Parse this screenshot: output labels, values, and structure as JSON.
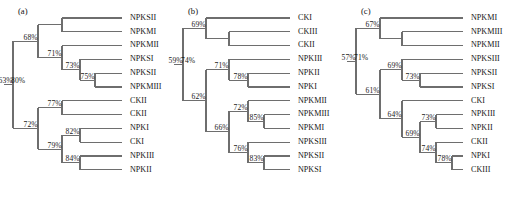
{
  "figure": {
    "width": 525,
    "height": 201,
    "background": "#ffffff",
    "link_color": "#6e6e6e",
    "text_color": "#171717"
  },
  "panels": [
    {
      "id": "a",
      "tag": "(a)",
      "root_support": "63%",
      "leaves": [
        "NPKSII",
        "NPKMI",
        "NPKMII",
        "NPKSI",
        "NPKSII",
        "NPKMIII",
        "CKII",
        "CKII",
        "NPKI",
        "CKI",
        "NPKIII",
        "NPKII"
      ],
      "supports": [
        "63%",
        "68%",
        "80%",
        "71%",
        "73%",
        "75%",
        "72%",
        "77%",
        "79%",
        "82%",
        "84%"
      ],
      "tree": {
        "support": "63%",
        "children": [
          {
            "support": "68%",
            "children": [
              {
                "support": "80%",
                "children": [
                  {
                    "leaf": "NPKSII"
                  },
                  {
                    "leaf": "NPKMI"
                  }
                ]
              },
              {
                "support": "71%",
                "children": [
                  {
                    "leaf": "NPKMII"
                  },
                  {
                    "support": "73%",
                    "children": [
                      {
                        "leaf": "NPKSI"
                      },
                      {
                        "support": "75%",
                        "children": [
                          {
                            "leaf": "NPKSII"
                          },
                          {
                            "leaf": "NPKMIII"
                          }
                        ]
                      }
                    ]
                  }
                ]
              }
            ]
          },
          {
            "support": "72%",
            "children": [
              {
                "support": "77%",
                "children": [
                  {
                    "leaf": "CKII"
                  },
                  {
                    "leaf": "CKII"
                  }
                ]
              },
              {
                "support": "79%",
                "children": [
                  {
                    "support": "82%",
                    "children": [
                      {
                        "leaf": "NPKI"
                      },
                      {
                        "leaf": "CKI"
                      }
                    ]
                  },
                  {
                    "support": "84%",
                    "children": [
                      {
                        "leaf": "NPKIII"
                      },
                      {
                        "leaf": "NPKII"
                      }
                    ]
                  }
                ]
              }
            ]
          }
        ]
      }
    },
    {
      "id": "b",
      "tag": "(b)",
      "root_support": "59%",
      "leaves": [
        "CKI",
        "CKIII",
        "CKII",
        "NPKIII",
        "NPKII",
        "NPKI",
        "NPKMII",
        "NPKMIII",
        "NPKMI",
        "NPKSIII",
        "NPKSII",
        "NPKSI"
      ],
      "supports": [
        "59%",
        "69%",
        "74%",
        "62%",
        "71%",
        "78%",
        "66%",
        "72%",
        "85%",
        "76%",
        "83%"
      ],
      "tree": {
        "support": "59%",
        "children": [
          {
            "support": "69%",
            "children": [
              {
                "leaf": "CKI"
              },
              {
                "support": "74%",
                "children": [
                  {
                    "leaf": "CKIII"
                  },
                  {
                    "leaf": "CKII"
                  }
                ]
              }
            ]
          },
          {
            "support": "62%",
            "children": [
              {
                "support": "71%",
                "children": [
                  {
                    "leaf": "NPKIII"
                  },
                  {
                    "support": "78%",
                    "children": [
                      {
                        "leaf": "NPKII"
                      },
                      {
                        "leaf": "NPKI"
                      }
                    ]
                  }
                ]
              },
              {
                "support": "66%",
                "children": [
                  {
                    "support": "72%",
                    "children": [
                      {
                        "leaf": "NPKMII"
                      },
                      {
                        "support": "85%",
                        "children": [
                          {
                            "leaf": "NPKMIII"
                          },
                          {
                            "leaf": "NPKMI"
                          }
                        ]
                      }
                    ]
                  },
                  {
                    "support": "76%",
                    "children": [
                      {
                        "leaf": "NPKSIII"
                      },
                      {
                        "support": "83%",
                        "children": [
                          {
                            "leaf": "NPKSII"
                          },
                          {
                            "leaf": "NPKSI"
                          }
                        ]
                      }
                    ]
                  }
                ]
              }
            ]
          }
        ]
      }
    },
    {
      "id": "c",
      "tag": "(c)",
      "root_support": "57%",
      "leaves": [
        "NPKMI",
        "NPKMIII",
        "NPKMII",
        "NPKSIII",
        "NPKSII",
        "NPKSI",
        "CKI",
        "NPKIII",
        "NPKII",
        "CKII",
        "NPKI",
        "CKIII"
      ],
      "supports": [
        "57%",
        "67%",
        "71%",
        "61%",
        "69%",
        "73%",
        "64%",
        "73%",
        "69%",
        "74%",
        "78%"
      ],
      "tree": {
        "support": "57%",
        "children": [
          {
            "support": "67%",
            "children": [
              {
                "leaf": "NPKMI"
              },
              {
                "support": "71%",
                "children": [
                  {
                    "leaf": "NPKMIII"
                  },
                  {
                    "leaf": "NPKMII"
                  }
                ]
              }
            ]
          },
          {
            "support": "61%",
            "children": [
              {
                "support": "69%",
                "children": [
                  {
                    "leaf": "NPKSIII"
                  },
                  {
                    "support": "73%",
                    "children": [
                      {
                        "leaf": "NPKSII"
                      },
                      {
                        "leaf": "NPKSI"
                      }
                    ]
                  }
                ]
              },
              {
                "support": "64%",
                "children": [
                  {
                    "leaf": "CKI"
                  },
                  {
                    "support": "69%",
                    "children": [
                      {
                        "support": "73%",
                        "children": [
                          {
                            "leaf": "NPKIII"
                          },
                          {
                            "leaf": "NPKII"
                          }
                        ]
                      },
                      {
                        "support": "74%",
                        "children": [
                          {
                            "leaf": "CKII"
                          },
                          {
                            "support": "78%",
                            "children": [
                              {
                                "leaf": "NPKI"
                              },
                              {
                                "leaf": "CKIII"
                              }
                            ]
                          }
                        ]
                      }
                    ]
                  }
                ]
              }
            ]
          }
        ]
      }
    }
  ]
}
